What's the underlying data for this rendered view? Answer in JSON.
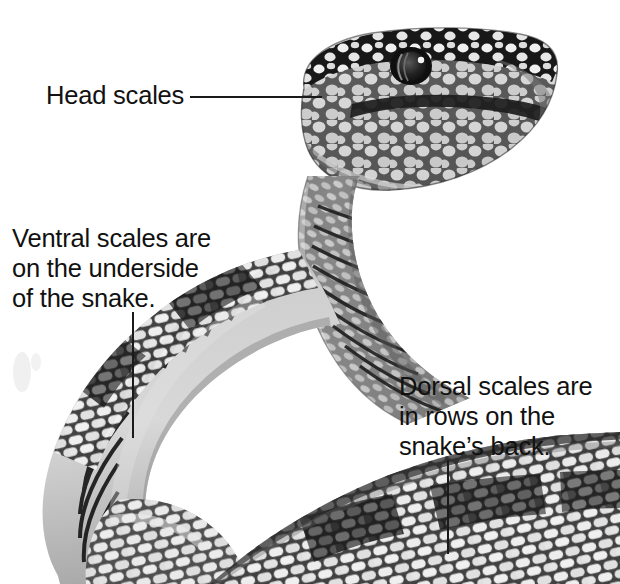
{
  "figure": {
    "background_color": "#ffffff",
    "ink_color": "#111111",
    "media": "grayscale photograph illustration of a snake with head raised"
  },
  "callouts": [
    {
      "id": "head-scales",
      "text": "Head scales",
      "leader": {
        "orientation": "horizontal",
        "x": 190,
        "y": 96,
        "length": 132
      },
      "points_to": "head-scales-region"
    },
    {
      "id": "ventral-scales",
      "text": "Ventral scales are\non the underside\nof the snake.",
      "leader": {
        "orientation": "vertical",
        "x": 132,
        "y": 312,
        "length": 126
      },
      "points_to": "ventral-scales-region"
    },
    {
      "id": "dorsal-scales",
      "text": "Dorsal scales are\nin rows on the\nsnake’s back.",
      "leader": {
        "orientation": "vertical",
        "x": 447,
        "y": 460,
        "length": 94
      },
      "points_to": "dorsal-scales-region"
    }
  ],
  "palette": {
    "paper": "#ffffff",
    "scale_light": "#ececec",
    "scale_mid": "#c2c2c2",
    "scale_shadow": "#8e8e8e",
    "scale_dark": "#2b2b2b",
    "outline": "#1a1a1a"
  }
}
